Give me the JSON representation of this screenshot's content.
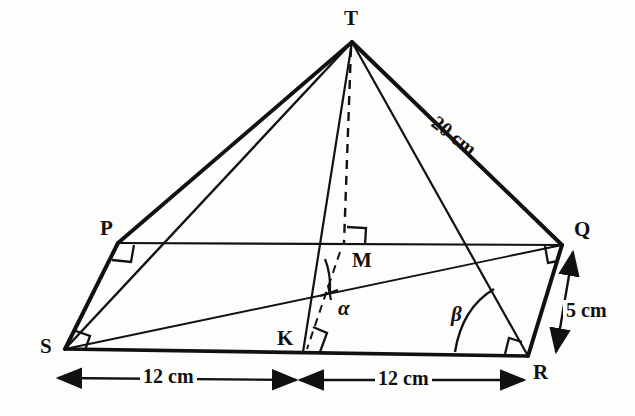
{
  "figure": {
    "kind": "geometry-diagram",
    "background_color": "#fdfdfb",
    "line_color": "#111111"
  },
  "vertices": [
    {
      "id": "T",
      "label": "T",
      "label_x": 344,
      "label_y": 8,
      "x": 352,
      "y": 42
    },
    {
      "id": "P",
      "label": "P",
      "label_x": 100,
      "label_y": 218,
      "x": 118,
      "y": 243
    },
    {
      "id": "Q",
      "label": "Q",
      "label_x": 574,
      "label_y": 219,
      "x": 562,
      "y": 245
    },
    {
      "id": "S",
      "label": "S",
      "label_x": 40,
      "label_y": 336,
      "x": 65,
      "y": 349
    },
    {
      "id": "R",
      "label": "R",
      "label_x": 533,
      "label_y": 362,
      "x": 528,
      "y": 356
    },
    {
      "id": "M",
      "label": "M",
      "label_x": 352,
      "label_y": 250,
      "x": 343,
      "y": 245
    },
    {
      "id": "K",
      "label": "K",
      "label_x": 277,
      "label_y": 328,
      "x": 303,
      "y": 352
    }
  ],
  "angles": [
    {
      "id": "alpha",
      "label": "α",
      "label_x": 338,
      "label_y": 298,
      "at_vertex": "K"
    },
    {
      "id": "beta",
      "label": "β",
      "label_x": 451,
      "label_y": 304,
      "at_vertex": "R"
    }
  ],
  "dimensions": [
    {
      "id": "slant-edge-TQ",
      "label": "20 cm",
      "value": 20,
      "unit": "cm",
      "from": "T",
      "to": "Q",
      "label_x": 432,
      "label_y": 108,
      "rotation": 38
    },
    {
      "id": "side-RQ",
      "label": "5 cm",
      "value": 5,
      "unit": "cm",
      "from": "R",
      "to": "Q",
      "label_x": 563,
      "label_y": 300,
      "rotation": 0
    },
    {
      "id": "base-SK",
      "label": "12 cm",
      "value": 12,
      "unit": "cm",
      "from": "S",
      "to": "K",
      "label_x": 140,
      "label_y": 366,
      "rotation": 0
    },
    {
      "id": "base-KR",
      "label": "12 cm",
      "value": 12,
      "unit": "cm",
      "from": "K",
      "to": "R",
      "label_x": 375,
      "label_y": 368,
      "rotation": 0
    }
  ],
  "right_angle_marks": [
    {
      "id": "right-angle-P",
      "at_vertex": "P"
    },
    {
      "id": "right-angle-S",
      "at_vertex": "S"
    },
    {
      "id": "right-angle-Q",
      "at_vertex": "Q"
    },
    {
      "id": "right-angle-R",
      "at_vertex": "R"
    },
    {
      "id": "right-angle-M",
      "at_vertex": "M"
    },
    {
      "id": "right-angle-K",
      "at_vertex": "K"
    }
  ],
  "edges": [
    {
      "id": "edge-PQ",
      "from": "P",
      "to": "Q",
      "style": "solid",
      "weight": "thin"
    },
    {
      "id": "edge-QR",
      "from": "Q",
      "to": "R",
      "style": "solid",
      "weight": "thick"
    },
    {
      "id": "edge-RS",
      "from": "R",
      "to": "S",
      "style": "solid",
      "weight": "thick"
    },
    {
      "id": "edge-SP",
      "from": "S",
      "to": "P",
      "style": "solid",
      "weight": "thick"
    },
    {
      "id": "edge-TP",
      "from": "T",
      "to": "P",
      "style": "solid",
      "weight": "thick"
    },
    {
      "id": "edge-TS",
      "from": "T",
      "to": "S",
      "style": "solid",
      "weight": "thin"
    },
    {
      "id": "edge-TQ",
      "from": "T",
      "to": "Q",
      "style": "solid",
      "weight": "thick"
    },
    {
      "id": "edge-TR",
      "from": "T",
      "to": "R",
      "style": "solid",
      "weight": "thin"
    },
    {
      "id": "edge-TK",
      "from": "T",
      "to": "K",
      "style": "solid",
      "weight": "thin"
    },
    {
      "id": "edge-TM",
      "from": "T",
      "to": "M",
      "style": "dashed",
      "weight": "thin"
    },
    {
      "id": "edge-MK",
      "from": "M",
      "to": "K",
      "style": "dashed",
      "weight": "thin"
    },
    {
      "id": "edge-SQ",
      "from": "S",
      "to": "Q",
      "style": "solid",
      "weight": "thin"
    }
  ]
}
